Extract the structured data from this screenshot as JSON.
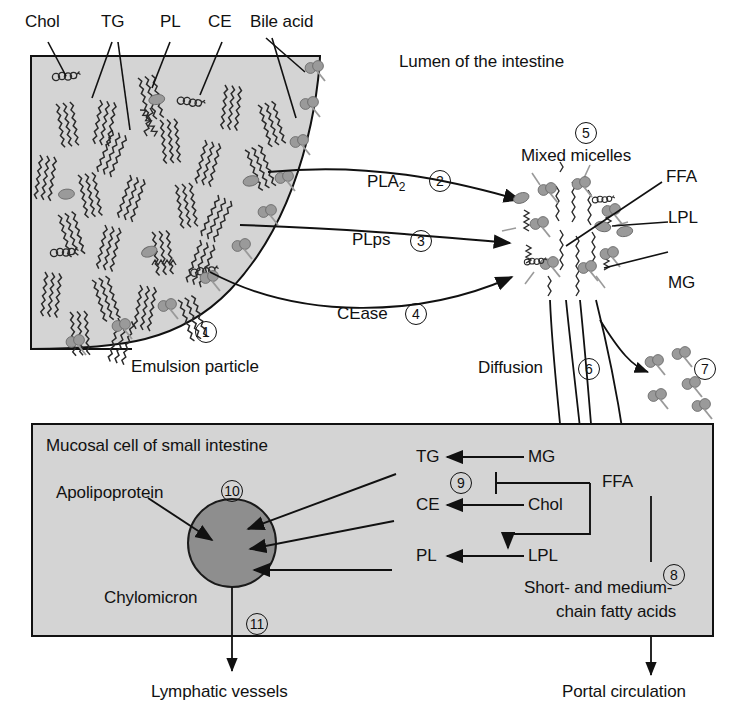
{
  "diagram": {
    "colors": {
      "box_fill": "#d4d4d4",
      "particle_gray": "#9a9a9a",
      "chylomicron_fill": "#8e8e8e",
      "stroke": "#111111",
      "background": "#ffffff"
    }
  },
  "top_labels": [
    {
      "id": "chol",
      "text": "Chol"
    },
    {
      "id": "tg",
      "text": "TG"
    },
    {
      "id": "pl",
      "text": "PL"
    },
    {
      "id": "ce",
      "text": "CE"
    },
    {
      "id": "bile_acid",
      "text": "Bile acid"
    }
  ],
  "lumen": {
    "label": "Lumen of the intestine"
  },
  "emulsion": {
    "label": "Emulsion particle",
    "number": "1"
  },
  "enzymes": [
    {
      "id": "pla2",
      "name": "PLA",
      "subscript": "2",
      "number": "2"
    },
    {
      "id": "plps",
      "name": "PLps",
      "subscript": "",
      "number": "3"
    },
    {
      "id": "cease",
      "name": "CEase",
      "subscript": "",
      "number": "4"
    }
  ],
  "micelles": {
    "number": "5",
    "label": "Mixed micelles",
    "components": [
      {
        "id": "ffa",
        "text": "FFA"
      },
      {
        "id": "lpl",
        "text": "LPL"
      },
      {
        "id": "mg",
        "text": "MG"
      }
    ]
  },
  "diffusion": {
    "label": "Diffusion",
    "number": "6"
  },
  "bile_acid_pool": {
    "number": "7"
  },
  "mucosal": {
    "label": "Mucosal cell of small intestine",
    "apolipoprotein_label": "Apolipoprotein",
    "chylomicron_label": "Chylomicron",
    "chylomicron_number": "10",
    "export_number": "11",
    "reactions": [
      {
        "product": "TG",
        "substrate": "MG"
      },
      {
        "product": "CE",
        "substrate": "Chol"
      },
      {
        "product": "PL",
        "substrate": "LPL"
      }
    ],
    "ffa_label": "FFA",
    "inhibition_number": "9"
  },
  "short_chain": {
    "number": "8",
    "line1": "Short- and medium-",
    "line2": "chain fatty acids"
  },
  "outputs": [
    {
      "id": "lymph",
      "text": "Lymphatic vessels"
    },
    {
      "id": "portal",
      "text": "Portal circulation"
    }
  ]
}
